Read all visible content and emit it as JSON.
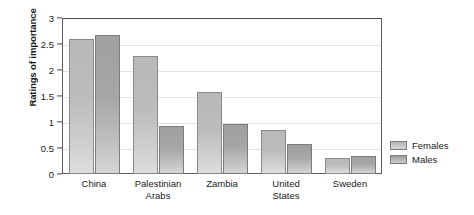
{
  "chart_data": {
    "type": "bar",
    "title": "",
    "xlabel": "",
    "ylabel": "Ratings of importance",
    "ylim": [
      0,
      3
    ],
    "yticks": [
      "0",
      "0.5",
      "1",
      "1.5",
      "2",
      "2.5",
      "3"
    ],
    "ytick_values": [
      0,
      0.5,
      1,
      1.5,
      2,
      2.5,
      3
    ],
    "grid": true,
    "grid_axis": "y",
    "legend_position": "right",
    "categories": [
      "China",
      "Palestinian Arabs",
      "Zambia",
      "United States",
      "Sweden"
    ],
    "category_lines": [
      [
        "China"
      ],
      [
        "Palestinian",
        "Arabs"
      ],
      [
        "Zambia"
      ],
      [
        "United",
        "States"
      ],
      [
        "Sweden"
      ]
    ],
    "series": [
      {
        "name": "Females",
        "color": "#bcbcbc",
        "values": [
          2.6,
          2.27,
          1.58,
          0.85,
          0.3
        ]
      },
      {
        "name": "Males",
        "color": "#a6a6a6",
        "values": [
          2.67,
          0.93,
          0.97,
          0.57,
          0.35
        ]
      }
    ]
  },
  "legend": {
    "items": [
      {
        "label": "Females"
      },
      {
        "label": "Males"
      }
    ]
  }
}
